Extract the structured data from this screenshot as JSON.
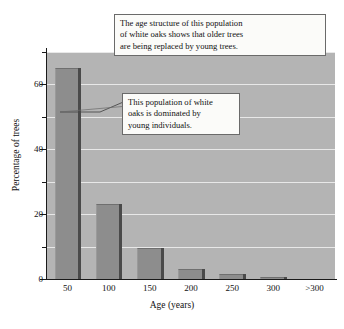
{
  "chart_data": {
    "type": "bar",
    "title": "",
    "xlabel": "Age (years)",
    "ylabel": "Percentage of trees",
    "categories": [
      "50",
      "100",
      "150",
      "200",
      "250",
      "300",
      ">300"
    ],
    "values": [
      65,
      23,
      9.5,
      3,
      1.5,
      0.6,
      0
    ],
    "ylim": [
      0,
      70
    ],
    "ytick_labels": [
      "0",
      "20",
      "40",
      "60"
    ],
    "ytick_values": [
      0,
      20,
      40,
      60
    ],
    "yminor_values": [
      10,
      30,
      50,
      70
    ],
    "grid": true,
    "grid_axis": "y",
    "legend": "none",
    "series": [
      {
        "name": "Percentage of trees",
        "values": [
          65,
          23,
          9.5,
          3,
          1.5,
          0.6,
          0
        ]
      }
    ],
    "annotations": [
      {
        "id": "top",
        "text": "The age structure of this population of white oaks shows that older trees are being replaced by young trees."
      },
      {
        "id": "bottom",
        "text": "This population of white oaks is dominated by young individuals.",
        "points_to": "50"
      }
    ]
  },
  "colors": {
    "bar_fill": "#8d8d8d",
    "bar_shadow": "#4a4a4a",
    "plot_background": "#b4b4b4",
    "gridline": "#e8e8e8",
    "axis": "#1a1a1a",
    "callout_background": "#fbfbf9",
    "callout_border": "#6a6a6a",
    "page_background": "#ffffff"
  },
  "axis": {
    "x_title": "Age (years)",
    "y_title": "Percentage of trees"
  },
  "callouts": {
    "top": {
      "line1": "The age structure of this population",
      "line2": "of white oaks shows that older trees",
      "line3": "are being replaced by young trees."
    },
    "bottom": {
      "line1": "This population of white",
      "line2": "oaks is dominated by",
      "line3": "young individuals."
    }
  },
  "ticks": {
    "y": [
      {
        "label": "60",
        "value": 60
      },
      {
        "label": "40",
        "value": 40
      },
      {
        "label": "20",
        "value": 20
      },
      {
        "label": "0",
        "value": 0
      }
    ],
    "x": [
      "50",
      "100",
      "150",
      "200",
      "250",
      "300",
      ">300"
    ]
  }
}
